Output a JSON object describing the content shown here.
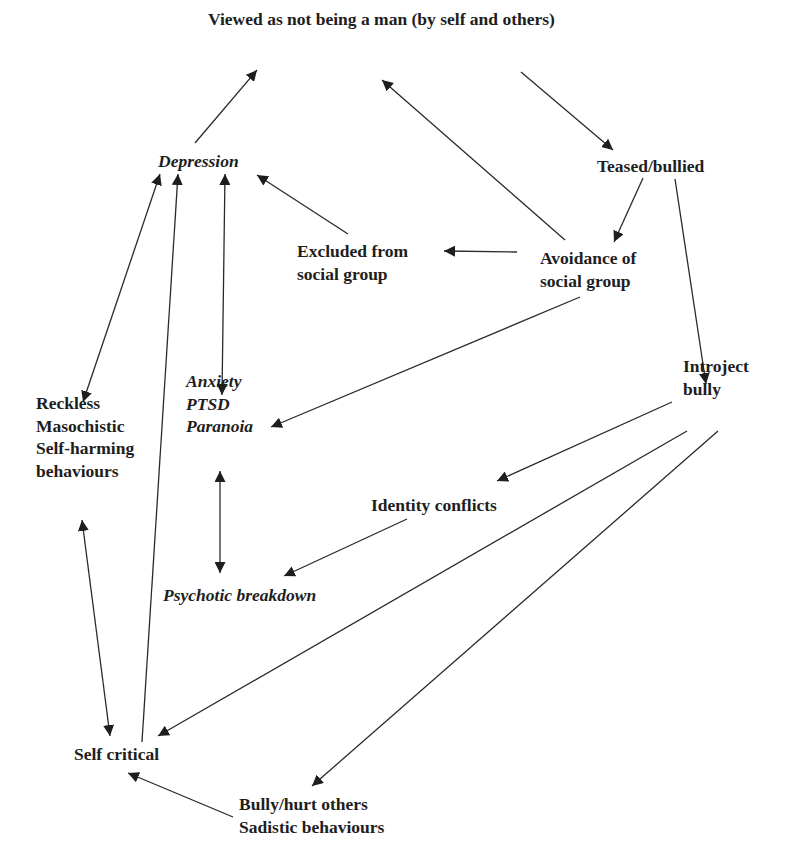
{
  "diagram": {
    "nodes": [
      {
        "id": "man",
        "lines": [
          "Viewed as not being a man (by self and others)"
        ],
        "italic": false,
        "x": 208,
        "y": 8
      },
      {
        "id": "teased",
        "lines": [
          "Teased/bullied"
        ],
        "italic": false,
        "x": 597,
        "y": 155
      },
      {
        "id": "depression",
        "lines": [
          "Depression"
        ],
        "italic": true,
        "x": 158,
        "y": 150
      },
      {
        "id": "excluded",
        "lines": [
          "Excluded from",
          "social group"
        ],
        "italic": false,
        "x": 297,
        "y": 240
      },
      {
        "id": "avoidance",
        "lines": [
          "Avoidance of",
          "social group"
        ],
        "italic": false,
        "x": 540,
        "y": 247
      },
      {
        "id": "anxiety",
        "lines": [
          "Anxiety",
          "PTSD",
          "Paranoia"
        ],
        "italic": true,
        "x": 186,
        "y": 370
      },
      {
        "id": "reckless",
        "lines": [
          "Reckless",
          "Masochistic",
          "Self-harming",
          "behaviours"
        ],
        "italic": false,
        "x": 36,
        "y": 392
      },
      {
        "id": "introject",
        "lines": [
          "Introject",
          "bully"
        ],
        "italic": false,
        "x": 683,
        "y": 355
      },
      {
        "id": "identity",
        "lines": [
          "Identity conflicts"
        ],
        "italic": false,
        "x": 371,
        "y": 494
      },
      {
        "id": "psychotic",
        "lines": [
          "Psychotic breakdown"
        ],
        "italic": true,
        "x": 163,
        "y": 584
      },
      {
        "id": "selfcritical",
        "lines": [
          "Self critical"
        ],
        "italic": false,
        "x": 74,
        "y": 743
      },
      {
        "id": "bully",
        "lines": [
          "Bully/hurt others",
          "Sadistic behaviours"
        ],
        "italic": false,
        "x": 239,
        "y": 793
      }
    ],
    "edges": [
      {
        "from": "depression",
        "to": "man",
        "x1": 195,
        "y1": 143,
        "x2": 257,
        "y2": 70,
        "bidirectional": false
      },
      {
        "from": "avoidance",
        "to": "man",
        "x1": 565,
        "y1": 240,
        "x2": 382,
        "y2": 80,
        "bidirectional": false
      },
      {
        "from": "man",
        "to": "teased",
        "x1": 521,
        "y1": 72,
        "x2": 613,
        "y2": 150,
        "bidirectional": false
      },
      {
        "from": "teased",
        "to": "avoidance",
        "x1": 643,
        "y1": 178,
        "x2": 614,
        "y2": 242,
        "bidirectional": false
      },
      {
        "from": "teased",
        "to": "introject",
        "x1": 675,
        "y1": 179,
        "x2": 706,
        "y2": 384,
        "bidirectional": false
      },
      {
        "from": "avoidance",
        "to": "excluded",
        "x1": 517,
        "y1": 252,
        "x2": 444,
        "y2": 251,
        "bidirectional": false
      },
      {
        "from": "excluded",
        "to": "depression",
        "x1": 348,
        "y1": 234,
        "x2": 257,
        "y2": 175,
        "bidirectional": false
      },
      {
        "from": "avoidance",
        "to": "anxiety",
        "x1": 580,
        "y1": 297,
        "x2": 271,
        "y2": 427,
        "bidirectional": false
      },
      {
        "from": "depression",
        "to": "anxiety",
        "x1": 225,
        "y1": 174,
        "x2": 222,
        "y2": 395,
        "bidirectional": true
      },
      {
        "from": "depression",
        "to": "reckless",
        "x1": 160,
        "y1": 174,
        "x2": 83,
        "y2": 402,
        "bidirectional": true
      },
      {
        "from": "selfcritical",
        "to": "depression",
        "x1": 142,
        "y1": 742,
        "x2": 178,
        "y2": 174,
        "bidirectional": false
      },
      {
        "from": "introject",
        "to": "identity",
        "x1": 672,
        "y1": 402,
        "x2": 497,
        "y2": 481,
        "bidirectional": false
      },
      {
        "from": "identity",
        "to": "psychotic",
        "x1": 407,
        "y1": 519,
        "x2": 284,
        "y2": 576,
        "bidirectional": false
      },
      {
        "from": "anxiety",
        "to": "psychotic",
        "x1": 220,
        "y1": 471,
        "x2": 220,
        "y2": 573,
        "bidirectional": true
      },
      {
        "from": "reckless",
        "to": "selfcritical",
        "x1": 82,
        "y1": 520,
        "x2": 110,
        "y2": 736,
        "bidirectional": true
      },
      {
        "from": "introject",
        "to": "selfcritical",
        "x1": 687,
        "y1": 431,
        "x2": 158,
        "y2": 736,
        "bidirectional": false
      },
      {
        "from": "introject",
        "to": "bully",
        "x1": 718,
        "y1": 431,
        "x2": 312,
        "y2": 786,
        "bidirectional": false
      },
      {
        "from": "bully",
        "to": "selfcritical",
        "x1": 233,
        "y1": 817,
        "x2": 128,
        "y2": 773,
        "bidirectional": false
      }
    ]
  }
}
